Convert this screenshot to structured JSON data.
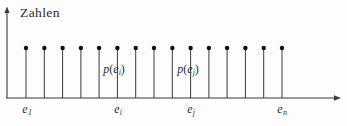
{
  "figure": {
    "background_color": "#fdfdfd",
    "line_color": "#3a3a3a",
    "marker_color": "#111111",
    "text_color": "#2f2f2f"
  },
  "axes": {
    "y_axis_label": "Zahlen",
    "y_axis_name": "y-axis-line",
    "x_axis_name": "x-axis-line",
    "x_axis_arrow": "arrow-right-icon",
    "y_axis_arrow": "arrow-up-icon"
  },
  "annotations": [
    {
      "id": "p-ei",
      "text_p": "p",
      "open": "(",
      "base": "e",
      "sub": "i",
      "close": ")",
      "x": 114,
      "y": 70
    },
    {
      "id": "p-ej",
      "text_p": "p",
      "open": "(",
      "base": "e",
      "sub": "j",
      "close": ")",
      "x": 188,
      "y": 70
    }
  ],
  "x_tick_labels": [
    {
      "id": "e1",
      "base": "e",
      "sub": "1",
      "x": 27
    },
    {
      "id": "ei",
      "base": "e",
      "sub": "i",
      "x": 118
    },
    {
      "id": "ej",
      "base": "e",
      "sub": "j",
      "x": 191
    },
    {
      "id": "en",
      "base": "e",
      "sub": "n",
      "x": 282
    }
  ],
  "chart_data": {
    "type": "bar",
    "subtype": "stem-plot",
    "title": "",
    "subtitle": "",
    "xlabel": "",
    "ylabel": "Zahlen",
    "grid": false,
    "legend": null,
    "xlim": [
      0,
      347
    ],
    "ylim": [
      0,
      1
    ],
    "baseline_y_px": 98,
    "stem_top_y_px": 48,
    "categories": [
      "e_1",
      "e_2",
      "e_3",
      "e_4",
      "e_5",
      "e_i",
      "e_7",
      "e_8",
      "e_9",
      "e_j",
      "e_11",
      "e_12",
      "e_13",
      "e_14",
      "e_n"
    ],
    "values": [
      1,
      1,
      1,
      1,
      1,
      1,
      1,
      1,
      1,
      1,
      1,
      1,
      1,
      1,
      1
    ],
    "x_positions_px": [
      26,
      44.3,
      62.6,
      80.9,
      99.1,
      117.4,
      135.7,
      154,
      172.3,
      190.6,
      208.9,
      227.1,
      245.4,
      263.7,
      282
    ],
    "labeled_categories": [
      "e_1",
      "e_i",
      "e_j",
      "e_n"
    ],
    "annotations": [
      "p(e_i)",
      "p(e_j)"
    ]
  }
}
